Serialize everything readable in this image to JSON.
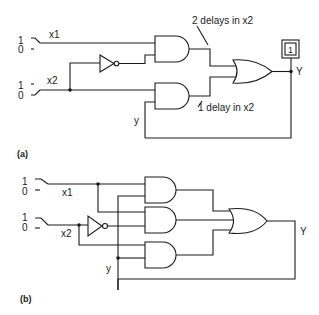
{
  "diagram_a": {
    "caption": "(a)",
    "inputs": [
      {
        "name": "x1",
        "switch_high": "1",
        "switch_low": "0"
      },
      {
        "name": "x2",
        "switch_high": "1",
        "switch_low": "0"
      }
    ],
    "feedback_label": "y",
    "output_label": "Y",
    "output_indicator": "1",
    "annotation_top": "2 delays in x2",
    "annotation_bottom": "1 delay in x2"
  },
  "diagram_b": {
    "caption": "(b)",
    "inputs": [
      {
        "name": "x1",
        "switch_high": "1",
        "switch_low": "0"
      },
      {
        "name": "x2",
        "switch_high": "1",
        "switch_low": "0"
      }
    ],
    "feedback_label": "y",
    "output_label": "Y"
  }
}
